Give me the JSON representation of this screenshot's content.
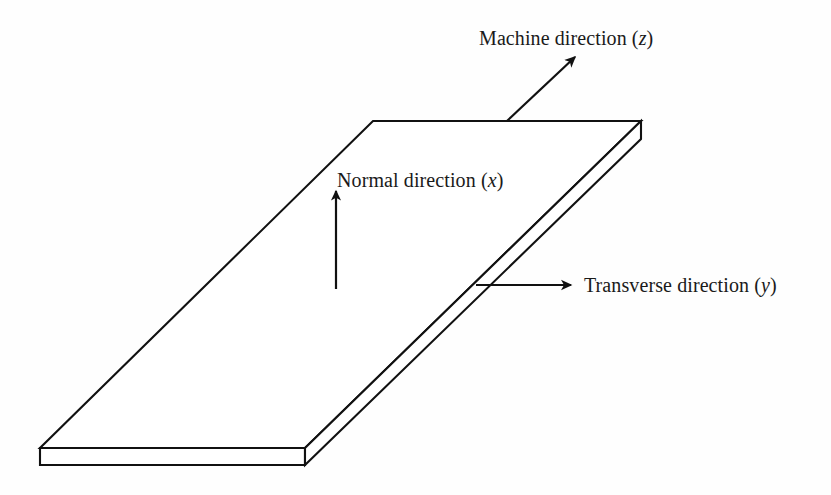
{
  "figure": {
    "background_color": "#fefefe",
    "stroke_color": "#111111",
    "fill_color": "#ffffff"
  },
  "labels": {
    "machine": {
      "text": "Machine direction (",
      "symbol": "z",
      "close": ")"
    },
    "normal": {
      "text": "Normal direction (",
      "symbol": "x",
      "close": ")"
    },
    "transverse": {
      "text": "Transverse direction (",
      "symbol": "y",
      "close": ")"
    }
  },
  "geometry": {
    "description": "Flat rectangular slab drawn in oblique projection with visible thickness",
    "slab_top_face": "373,121 641,121 305,448 40,448",
    "slab_front_left_face": "40,448 305,448 305,465 40,465",
    "slab_front_right_face": "305,448 641,121 641,139 305,465",
    "thickness_px": 17
  },
  "arrows": {
    "machine": {
      "from_x": 507,
      "from_y": 121,
      "to_x": 575,
      "to_y": 57
    },
    "normal": {
      "from_x": 336,
      "from_y": 289,
      "to_x": 336,
      "to_y": 191
    },
    "transverse": {
      "from_x": 476,
      "from_y": 285,
      "to_x": 571,
      "to_y": 285
    }
  }
}
